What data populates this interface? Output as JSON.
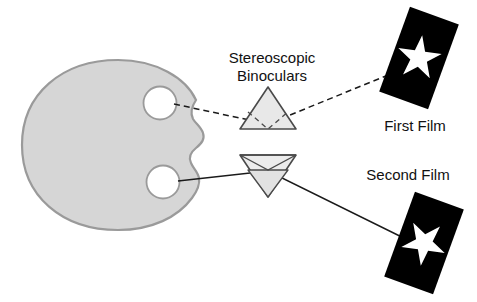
{
  "diagram": {
    "title_visible": false,
    "background_color": "#ffffff",
    "labels": {
      "binoculars_line1": "Stereoscopic",
      "binoculars_line2": "Binoculars",
      "first_film": "First Film",
      "second_film": "Second Film"
    },
    "colors": {
      "head_fill": "#d6d6d6",
      "head_stroke": "#9a9a9a",
      "eye_fill": "#ffffff",
      "eye_stroke": "#9a9a9a",
      "prism_fill": "#e8e8e8",
      "prism_stroke": "#555555",
      "film_fill": "#000000",
      "star_fill": "#ffffff",
      "ray_solid": "#1a1a1a",
      "ray_dashed": "#1a1a1a",
      "text": "#111111"
    },
    "elements": {
      "head": {
        "name": "viewer-head",
        "cx": 118,
        "cy": 145,
        "rx": 100,
        "ry": 85
      },
      "upper_eye": {
        "name": "upper-eye",
        "cx": 160,
        "cy": 103,
        "r": 16
      },
      "lower_eye": {
        "name": "lower-eye",
        "cx": 163,
        "cy": 182,
        "r": 16
      },
      "upper_prism": {
        "name": "upper-prism-triangle",
        "apex_x": 268,
        "apex_y": 88,
        "base_y": 128,
        "half_width": 28,
        "orientation": "up"
      },
      "lower_prism": {
        "name": "lower-prism-triangle",
        "apex_x": 268,
        "apex_y": 196,
        "base_y": 155,
        "half_width": 28,
        "orientation": "down"
      },
      "first_film": {
        "name": "first-film-frame",
        "cx": 419,
        "cy": 58,
        "width": 52,
        "height": 86,
        "rotation_deg": 20
      },
      "second_film": {
        "name": "second-film-frame",
        "cx": 424,
        "cy": 243,
        "width": 52,
        "height": 86,
        "rotation_deg": 20
      }
    },
    "rays": {
      "upper_ray_style": "dashed",
      "lower_ray_style": "solid",
      "upper_ray_path": "from upper eye through upper prism to first film star",
      "lower_ray_path": "from lower eye through lower prism to second film star"
    }
  }
}
